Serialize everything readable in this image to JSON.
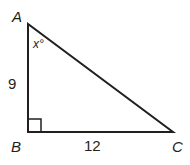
{
  "diagram": {
    "type": "right-triangle",
    "vertices": [
      {
        "label": "A",
        "x": 28,
        "y": 24
      },
      {
        "label": "B",
        "x": 28,
        "y": 132
      },
      {
        "label": "C",
        "x": 173,
        "y": 132
      }
    ],
    "angle_label": "x°",
    "side_labels": {
      "AB": "9",
      "BC": "12"
    },
    "right_angle_at": "B",
    "stroke_color": "#231f20"
  }
}
